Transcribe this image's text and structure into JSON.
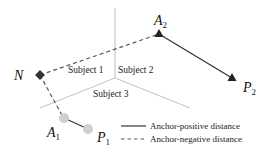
{
  "diagram": {
    "regions": [
      {
        "id": "subject-1",
        "label": "Subject 1"
      },
      {
        "id": "subject-2",
        "label": "Subject 2"
      },
      {
        "id": "subject-3",
        "label": "Subject 3"
      }
    ],
    "points": {
      "N": {
        "label": "N",
        "sub": ""
      },
      "A1": {
        "label": "A",
        "sub": "1"
      },
      "P1": {
        "label": "P",
        "sub": "1"
      },
      "A2": {
        "label": "A",
        "sub": "2"
      },
      "P2": {
        "label": "P",
        "sub": "2"
      }
    },
    "legend": {
      "positive": "Anchor-positive  distance",
      "negative": "Anchor-negative distance"
    },
    "colors": {
      "divider": "#b8b8b8",
      "line": "#333333",
      "dashed": "#555555",
      "circle": "#cfcfcf",
      "triangle": "#222222",
      "diamond": "#333333"
    }
  }
}
